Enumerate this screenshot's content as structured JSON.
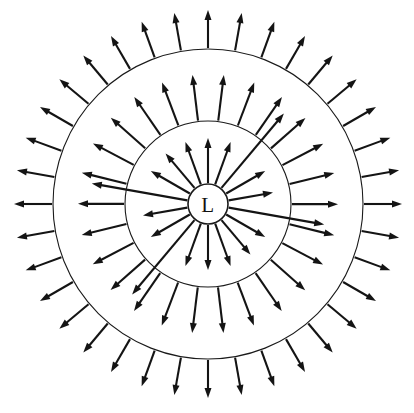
{
  "diagram": {
    "name": "radiating-field-diagram",
    "background_color": "#ffffff",
    "stroke_color": "#141414",
    "canvas": {
      "width": 414,
      "height": 413
    },
    "center": {
      "x": 208,
      "y": 204
    },
    "source": {
      "label": "L",
      "radius": 20,
      "fill_color": "#ffffff",
      "stroke_color": "#1a1a1a"
    },
    "circles": [
      {
        "name": "inner-circle",
        "radius": 83,
        "stroke_color": "#1a1a1a",
        "stroke_width": 1.1
      },
      {
        "name": "outer-circle",
        "radius": 155,
        "stroke_color": "#1a1a1a",
        "stroke_width": 1.1
      }
    ],
    "arrow_groups": [
      {
        "name": "source-rays",
        "count": 18,
        "start_radius": 21,
        "end_radius": 66,
        "angle_offset_deg": 0,
        "head_length": 10,
        "head_width": 7,
        "long_ray_indices": [
          2,
          5,
          11,
          14
        ],
        "long_ray_end_radius": 118
      },
      {
        "name": "inner-ring-rays",
        "count": 26,
        "start_radius": 84,
        "end_radius": 130,
        "angle_offset_deg": 7,
        "head_length": 10,
        "head_width": 7
      },
      {
        "name": "outer-ring-rays",
        "count": 36,
        "start_radius": 156,
        "end_radius": 194,
        "angle_offset_deg": 0,
        "head_length": 10,
        "head_width": 7
      }
    ]
  }
}
